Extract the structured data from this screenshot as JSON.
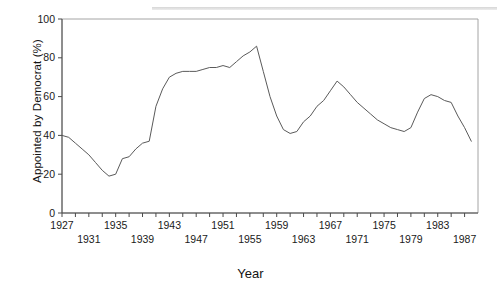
{
  "figure": {
    "background_color": "#ffffff",
    "line_color": "#5a5a5a",
    "axis_color": "#4a4a4a",
    "y_axis_title": "Appointed by Democrat (%)",
    "x_axis_title": "Year"
  },
  "axes": {
    "y_ticks": [
      "0",
      "20",
      "40",
      "60",
      "80",
      "100"
    ],
    "x_ticks_row1": [
      "1927",
      "1935",
      "1943",
      "1951",
      "1959",
      "1967",
      "1975",
      "1983"
    ],
    "x_ticks_row2": [
      "1931",
      "1939",
      "1947",
      "1955",
      "1963",
      "1971",
      "1979",
      "1987"
    ]
  },
  "chart_data": {
    "type": "line",
    "title": "",
    "subtitle": "",
    "xlabel": "Year",
    "ylabel": "Appointed by Democrat (%)",
    "xlim": [
      1927,
      1989
    ],
    "ylim": [
      0,
      100
    ],
    "grid": false,
    "legend": "none",
    "x": [
      1927,
      1928,
      1929,
      1930,
      1931,
      1932,
      1933,
      1934,
      1935,
      1936,
      1937,
      1938,
      1939,
      1940,
      1941,
      1942,
      1943,
      1944,
      1945,
      1946,
      1947,
      1948,
      1949,
      1950,
      1951,
      1952,
      1953,
      1954,
      1955,
      1956,
      1957,
      1958,
      1959,
      1960,
      1961,
      1962,
      1963,
      1964,
      1965,
      1966,
      1967,
      1968,
      1969,
      1970,
      1971,
      1972,
      1973,
      1974,
      1975,
      1976,
      1977,
      1978,
      1979,
      1980,
      1981,
      1982,
      1983,
      1984,
      1985,
      1986,
      1987,
      1988
    ],
    "y": [
      40,
      39,
      36,
      33,
      30,
      26,
      22,
      19,
      20,
      28,
      29,
      33,
      36,
      37,
      55,
      64,
      70,
      72,
      73,
      73,
      73,
      74,
      75,
      75,
      76,
      75,
      78,
      81,
      83,
      86,
      73,
      60,
      50,
      43,
      41,
      42,
      47,
      50,
      55,
      58,
      63,
      68,
      65,
      61,
      57,
      54,
      51,
      48,
      46,
      44,
      43,
      42,
      44,
      52,
      59,
      61,
      60,
      58,
      57,
      50,
      44,
      37
    ],
    "series": [
      {
        "name": "Appointed by Democrat (%)",
        "values": [
          40,
          39,
          36,
          33,
          30,
          26,
          22,
          19,
          20,
          28,
          29,
          33,
          36,
          37,
          55,
          64,
          70,
          72,
          73,
          73,
          73,
          74,
          75,
          75,
          76,
          75,
          78,
          81,
          83,
          86,
          73,
          60,
          50,
          43,
          41,
          42,
          47,
          50,
          55,
          58,
          63,
          68,
          65,
          61,
          57,
          54,
          51,
          48,
          46,
          44,
          43,
          42,
          44,
          52,
          59,
          61,
          60,
          58,
          57,
          50,
          44,
          37
        ]
      }
    ],
    "annotations": []
  }
}
